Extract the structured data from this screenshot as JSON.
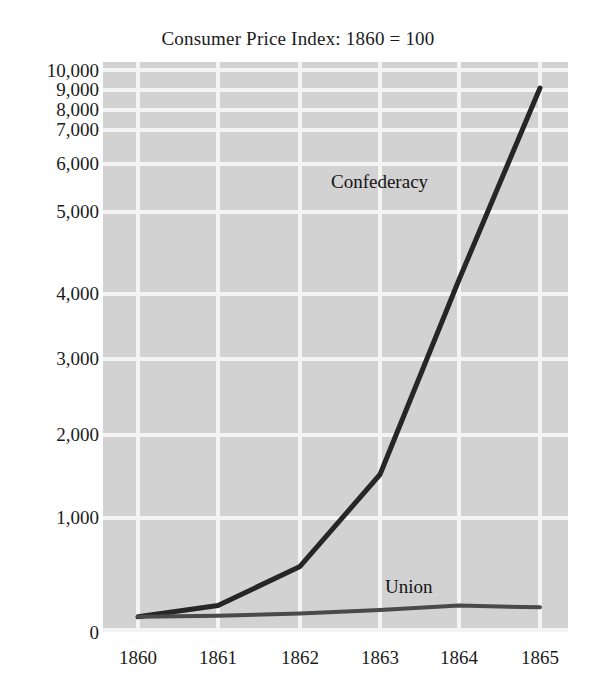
{
  "chart_data": {
    "type": "line",
    "title": "Consumer Price Index: 1860 = 100",
    "xlabel": "",
    "ylabel": "",
    "x": [
      1860,
      1861,
      1862,
      1863,
      1864,
      1865
    ],
    "xticklabels": [
      "1860",
      "1861",
      "1862",
      "1863",
      "1864",
      "1865"
    ],
    "yticks": [
      0,
      1000,
      2000,
      3000,
      4000,
      5000,
      6000,
      7000,
      8000,
      9000,
      10000
    ],
    "yticklabels": [
      "0",
      "1,000",
      "2,000",
      "3,000",
      "4,000",
      "5,000",
      "6,000",
      "7,000",
      "8,000",
      "9,000",
      "10,000"
    ],
    "ylim": [
      0,
      10000
    ],
    "yscale": "compressed-nonlinear",
    "grid": true,
    "grid_color": "#f4f4f4",
    "plot_background": "#d2d2d2",
    "legend": "inline-annotations",
    "series": [
      {
        "name": "Confederacy",
        "color": "#262626",
        "values": [
          100,
          200,
          550,
          1500,
          4150,
          9000
        ],
        "label_text": "Confederacy"
      },
      {
        "name": "Union",
        "color": "#4a4a4a",
        "values": [
          100,
          110,
          130,
          160,
          200,
          185
        ],
        "label_text": "Union"
      }
    ]
  }
}
